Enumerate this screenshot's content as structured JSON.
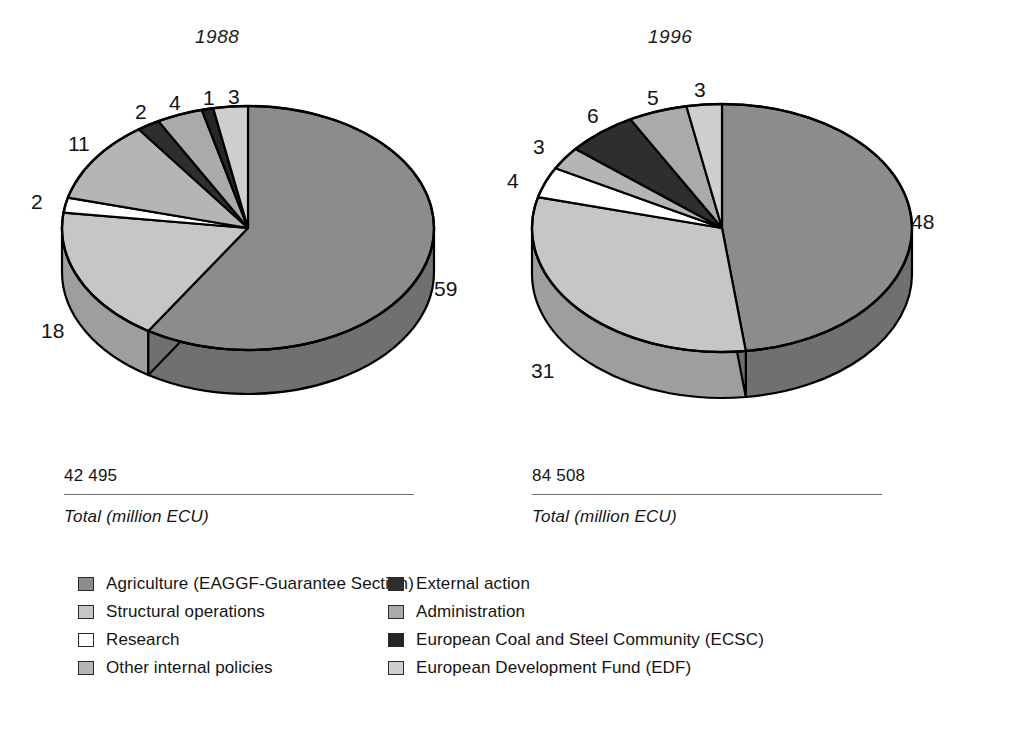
{
  "chart_data": [
    {
      "type": "pie",
      "title": "1988",
      "categories": [
        "Agriculture (EAGGF-Guarantee Section)",
        "Structural operations",
        "Research",
        "Other internal policies",
        "External action",
        "Administration",
        "European Coal and Steel Community (ECSC)",
        "European Development Fund (EDF)"
      ],
      "values": [
        59,
        18,
        2,
        11,
        2,
        4,
        1,
        3
      ],
      "value_labels": [
        "59",
        "18",
        "2",
        "11",
        "2",
        "4",
        "1",
        "3"
      ],
      "unit": "%",
      "total_value": "42 495",
      "total_caption": "Total (million ECU)",
      "legend": "shared"
    },
    {
      "type": "pie",
      "title": "1996",
      "categories": [
        "Agriculture (EAGGF-Guarantee Section)",
        "Structural operations",
        "Research",
        "Other internal policies",
        "External action",
        "Administration",
        "European Coal and Steel Community (ECSC)",
        "European Development Fund (EDF)"
      ],
      "values": [
        48,
        31,
        4,
        3,
        6,
        5,
        0,
        3
      ],
      "value_labels": [
        "48",
        "31",
        "4",
        "3",
        "6",
        "5",
        "",
        "3"
      ],
      "unit": "%",
      "total_value": "84 508",
      "total_caption": "Total (million ECU)",
      "legend": "shared"
    }
  ],
  "charts": {
    "c1988": {
      "title": "1988",
      "labels": {
        "agriculture": "59",
        "structural": "18",
        "research": "2",
        "other_internal": "11",
        "external": "2",
        "administration": "4",
        "ecsc": "1",
        "edf": "3"
      }
    },
    "c1996": {
      "title": "1996",
      "labels": {
        "agriculture": "48",
        "structural": "31",
        "research": "4",
        "other_internal": "3",
        "external": "6",
        "administration": "5",
        "edf": "3"
      }
    }
  },
  "totals": {
    "t1988": {
      "value": "42 495",
      "caption": "Total (million ECU)"
    },
    "t1996": {
      "value": "84 508",
      "caption": "Total (million ECU)"
    }
  },
  "legend": {
    "left": [
      {
        "label": "Agriculture (EAGGF-Guarantee Section)",
        "color": "#8c8c8c"
      },
      {
        "label": "Structural operations",
        "color": "#c6c6c6"
      },
      {
        "label": "Research",
        "color": "#ffffff"
      },
      {
        "label": "Other internal policies",
        "color": "#b5b5b5"
      }
    ],
    "right": [
      {
        "label": "External action",
        "color": "#2e2e2e"
      },
      {
        "label": "Administration",
        "color": "#aaaaaa"
      },
      {
        "label": "European Coal and Steel Community (ECSC)",
        "color": "#262626"
      },
      {
        "label": "European Development Fund (EDF)",
        "color": "#cfcfcf"
      }
    ]
  },
  "palette": {
    "agriculture": "#8c8c8c",
    "structural": "#c6c6c6",
    "research": "#ffffff",
    "other_internal": "#b5b5b5",
    "external": "#2e2e2e",
    "administration": "#aaaaaa",
    "ecsc": "#262626",
    "edf": "#cfcfcf",
    "outline": "#000000",
    "rule": "#6d6d6d",
    "text": "#141414"
  }
}
